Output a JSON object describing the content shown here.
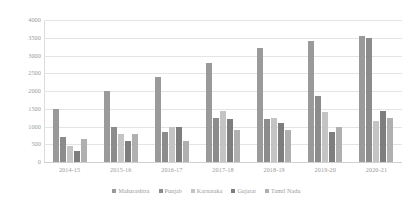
{
  "chart_data": {
    "type": "bar",
    "title": "",
    "xlabel": "",
    "ylabel": "",
    "grid": true,
    "legend_position": "bottom",
    "ylim": [
      0,
      4000
    ],
    "ytick_labels": [
      "4000",
      "3500",
      "3000",
      "2500",
      "2000",
      "1500",
      "1000",
      "500",
      "0"
    ],
    "ytick_values": [
      4000,
      3500,
      3000,
      2500,
      2000,
      1500,
      1000,
      500,
      0
    ],
    "categories": [
      "2014-15",
      "2015-16",
      "2016-17",
      "2017-18",
      "2018-19",
      "2019-20",
      "2020-21"
    ],
    "series": [
      {
        "name": "Maharashtra",
        "color": "#9a9a9a",
        "values": [
          1500,
          2000,
          2400,
          2800,
          3200,
          3400,
          3550
        ]
      },
      {
        "name": "Punjab",
        "color": "#8c8c8c",
        "values": [
          700,
          1000,
          850,
          1250,
          1200,
          1850,
          3500
        ]
      },
      {
        "name": "Karnataka",
        "color": "#c4c4c4",
        "values": [
          450,
          800,
          1000,
          1450,
          1250,
          1400,
          1150
        ]
      },
      {
        "name": "Gujarat",
        "color": "#7e7e7e",
        "values": [
          300,
          600,
          1000,
          1200,
          1100,
          850,
          1450
        ]
      },
      {
        "name": "Tamil Nadu",
        "color": "#b0b0b0",
        "values": [
          650,
          800,
          600,
          900,
          900,
          1000,
          1250
        ]
      }
    ]
  }
}
